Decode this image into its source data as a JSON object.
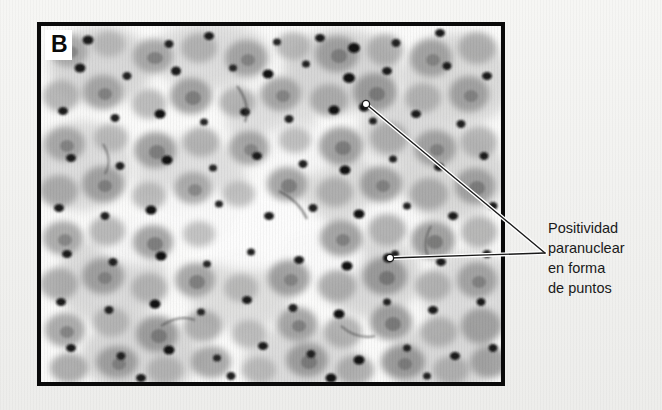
{
  "figure": {
    "panel_letter": "B",
    "background_color": "#f2f2f0",
    "frame_color": "#0a0a0a",
    "image_type": "histology-micrograph",
    "stain_description": "immunohistochemistry, brown-grey cytoplasm with dark punctate dots"
  },
  "annotation": {
    "lines": [
      "Positividad",
      "paranuclear",
      "en forma",
      "de puntos"
    ],
    "full_text": "Positividad paranuclear en forma de puntos",
    "text_color": "#1a1a1a",
    "leader_color": "#1a1a1a",
    "leader_outline_color": "#ffffff",
    "pointers": [
      {
        "label": "upper-dot",
        "x": 366,
        "y": 104
      },
      {
        "label": "lower-dot",
        "x": 390,
        "y": 258
      }
    ],
    "convergence": {
      "x": 545,
      "y": 253
    }
  },
  "micrograph": {
    "caption_marker": "B",
    "dark_dot_count": 96,
    "cell_count": 150
  }
}
